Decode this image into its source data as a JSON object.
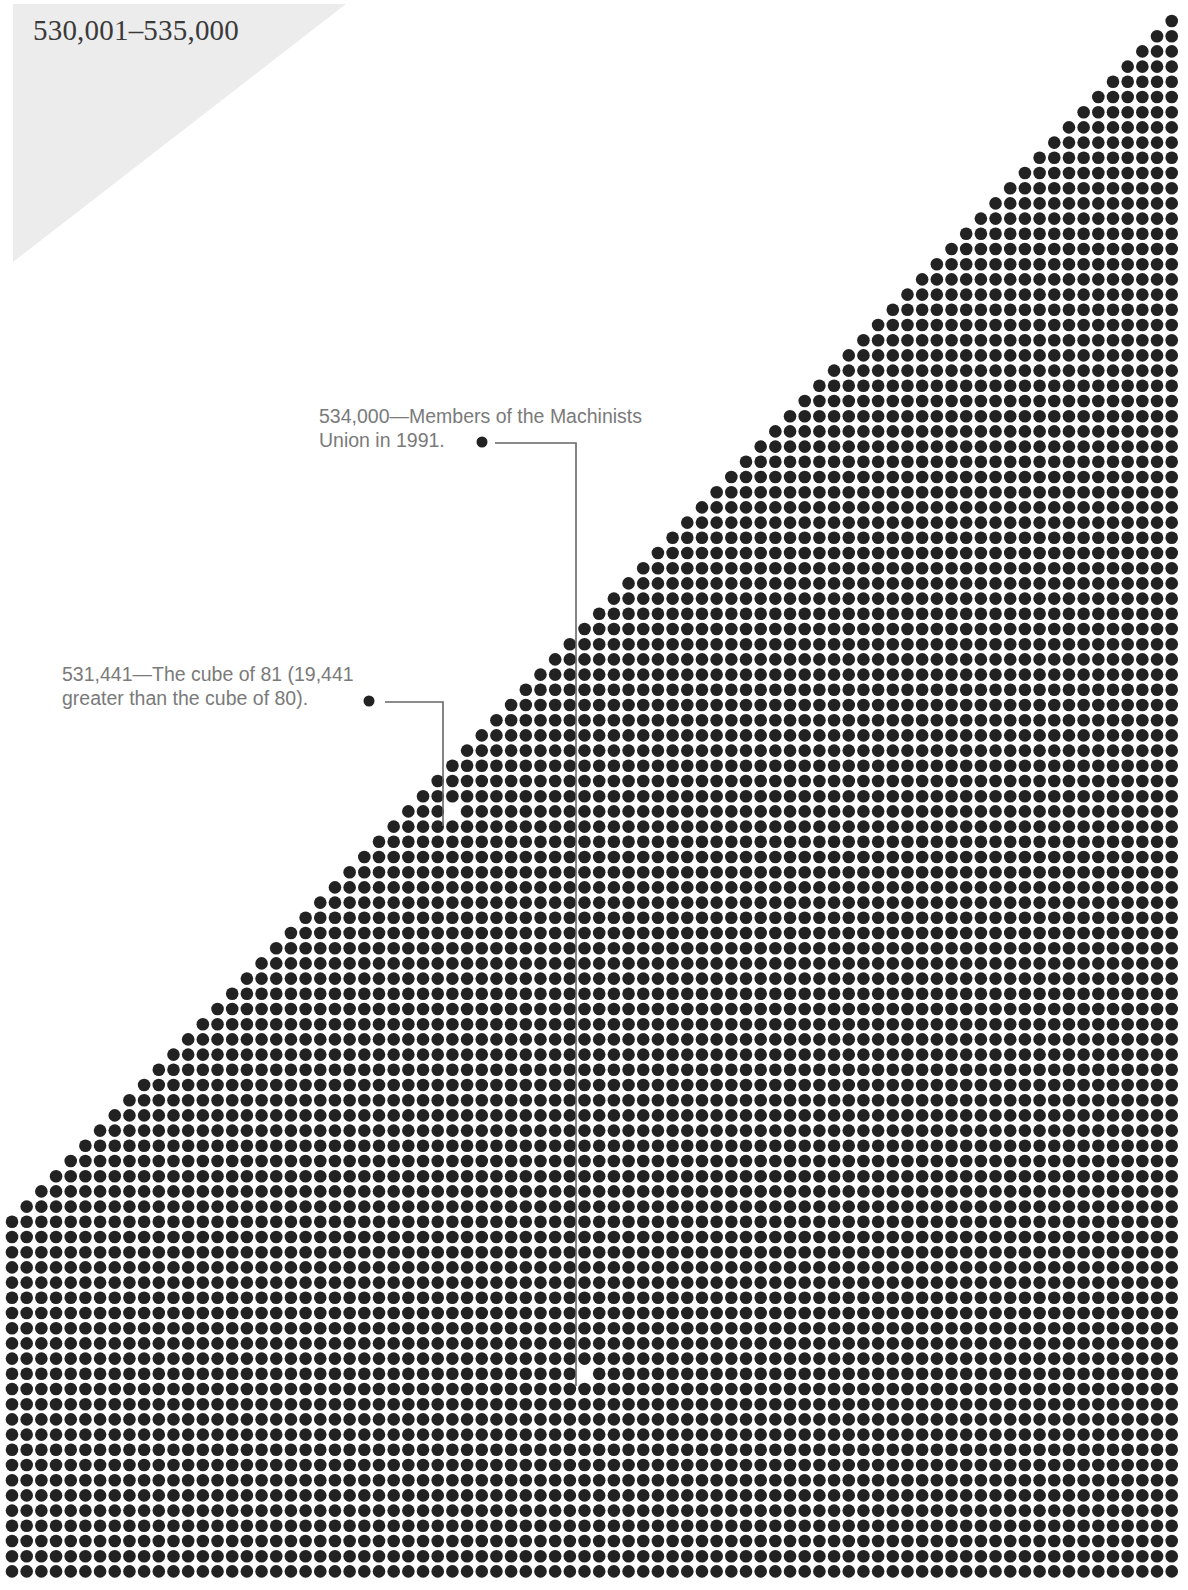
{
  "header": {
    "range_title": "530,001–535,000"
  },
  "annotations": [
    {
      "id": "machinists",
      "line1": "534,000—Members of the Machinists",
      "line2": "Union in 1991.",
      "text_x": 319,
      "text_y": 404,
      "bullet": [
        482,
        442
      ],
      "leader": [
        [
          495,
          443
        ],
        [
          576,
          443
        ],
        [
          576,
          1386
        ]
      ],
      "marked_dot": {
        "col": 39,
        "row": 89
      }
    },
    {
      "id": "cube-of-81",
      "line1": "531,441—The cube of 81 (19,441",
      "line2": "greater than the cube of 80).",
      "text_x": 62,
      "text_y": 662,
      "bullet": [
        369,
        701
      ],
      "leader": [
        [
          385,
          702
        ],
        [
          443,
          702
        ],
        [
          443,
          826
        ]
      ],
      "marked_dot": {
        "col": 30,
        "row": 52
      }
    }
  ],
  "dot_grid": {
    "columns": 80,
    "rows": 103,
    "start_x": 12,
    "start_y": 21,
    "pitch_x": 14.68,
    "pitch_y": 15.2,
    "radius": 6.3,
    "staircase_full_row": 79,
    "dot_color": "#222222"
  },
  "colors": {
    "corner_tab": "#ececec",
    "title": "#3a3a3a",
    "annotation_text": "#7a7a7a",
    "leader_line": "#666666"
  }
}
